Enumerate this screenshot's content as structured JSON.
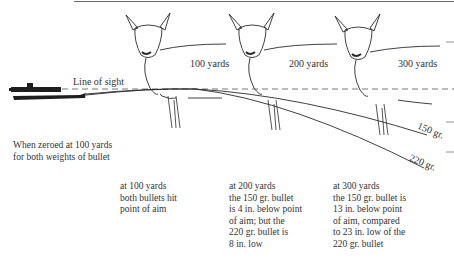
{
  "diagram": {
    "title_rule": true,
    "line_of_sight_label": "Line of sight",
    "distances": [
      {
        "label": "100 yards",
        "x": 160
      },
      {
        "label": "200 yards",
        "x": 289
      },
      {
        "label": "300 yards",
        "x": 396
      }
    ],
    "bullets": [
      {
        "label": "150 gr.",
        "drop_at_200_in": 4,
        "drop_at_300_in": 13
      },
      {
        "label": "220 gr.",
        "drop_at_200_in": 8,
        "drop_at_300_in": 23
      }
    ],
    "zero_note": [
      "When zeroed at 100 yards",
      "for both weights of bullet"
    ],
    "captions": [
      {
        "lines": [
          "at 100 yards",
          "both bullets hit",
          "point of aim"
        ]
      },
      {
        "lines": [
          "at 200 yards",
          "the 150 gr. bullet",
          "is 4 in. below point",
          "of aim; but the",
          "220 gr. bullet is",
          "8 in. low"
        ]
      },
      {
        "lines": [
          "at 300 yards",
          "the 150 gr. bullet is",
          "13 in. below point",
          "of aim, compared",
          "to 23 in. low of the",
          "220 gr. bullet"
        ]
      }
    ],
    "icons": [
      "rifle-icon",
      "deer-icon",
      "deer-icon",
      "deer-icon"
    ],
    "colors": {
      "ink": "#2a2a2a",
      "rule": "#6a6a6a",
      "background": "#ffffff"
    }
  }
}
